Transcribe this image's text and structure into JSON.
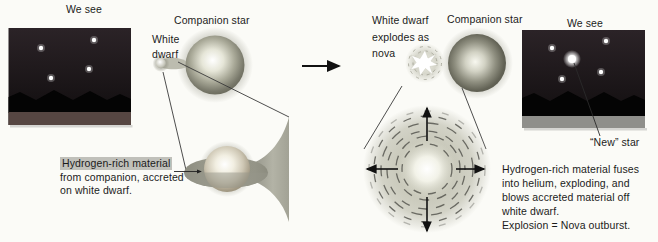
{
  "left_panel": {
    "we_see_label": "We see",
    "companion_star_label": "Companion star",
    "white_dwarf_label": "White dwarf",
    "caption_highlight": "Hydrogen-rich material",
    "caption_rest": "from companion, accreted on white dwarf."
  },
  "right_panel": {
    "white_dwarf_explodes_label": "White dwarf explodes as nova",
    "companion_star_label": "Companion star",
    "we_see_label": "We see",
    "new_star_label": "“New” star",
    "caption_main": "Hydrogen-rich material fuses into helium, exploding, and blows accreted material off white dwarf.",
    "caption_equation": "Explosion = Nova outburst."
  },
  "colors": {
    "page_background": "#fbfbf7",
    "sky_top": "#2b2327",
    "sky_bottom": "#0f0c0d",
    "ground_left": "#564642",
    "ground_right": "#8f8f8b",
    "highlight_background": "#c0c0ba",
    "text": "#1b1b1b",
    "star_color": "#ffffff",
    "nebula_gray": "#a8a89a"
  }
}
